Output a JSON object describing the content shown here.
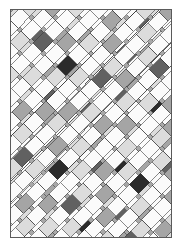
{
  "artwork": {
    "title": "Diagonal Lattice Weave",
    "kind": "abstract-generative-pattern",
    "caption": ""
  },
  "page": {
    "width": 182,
    "height": 247,
    "background_color": "#ffffff",
    "margin_left": 10,
    "margin_top": 9,
    "margin_right": 10,
    "margin_bottom": 9
  },
  "canvas": {
    "x": 10,
    "y": 9,
    "width": 162,
    "height": 229,
    "background_color": "#a8a8a8",
    "border_color": "#5a5a5a",
    "border_width": 1
  },
  "palette": {
    "background_gray": "#a8a8a8",
    "white": "#fbfbfb",
    "light_gray": "#dcdcdc",
    "mid_gray": "#a5a5a5",
    "dark_gray": "#616161",
    "near_black": "#2b2b2b",
    "outline": "#3a3a3a",
    "frame": "#5a5a5a"
  },
  "geometry": {
    "strip_angle_a_deg": 45,
    "strip_angle_b_deg": -45,
    "strip_width": 13,
    "strip_pitch": 17,
    "cell_outline_width": 0.6,
    "description": "Two interleaved families of parallel diagonal bands at plus and minus 45 degrees; each band is chopped into rectangular cells of varying grayscale value, creating a plaited basket-weave lattice clipped to the canvas rectangle."
  },
  "chart_data": {
    "type": "heatmap",
    "title": "Diagonal Lattice Weave",
    "xlabel": "",
    "ylabel": "",
    "legend": [],
    "grid": false,
    "tone_levels": [
      0,
      1,
      2,
      3,
      4
    ],
    "tone_colors": [
      "#fbfbfb",
      "#dcdcdc",
      "#a5a5a5",
      "#616161",
      "#2b2b2b"
    ],
    "tone_labels": [
      "white",
      "light",
      "mid",
      "dark",
      "black"
    ],
    "bands_a": [
      {
        "index": 0,
        "offset": -150,
        "cells": [
          0,
          2,
          0,
          1,
          0,
          3,
          0,
          0,
          1,
          0,
          2,
          0,
          0,
          1,
          0,
          0,
          0,
          2,
          0,
          1
        ]
      },
      {
        "index": 1,
        "offset": -133,
        "cells": [
          1,
          0,
          3,
          0,
          0,
          2,
          0,
          1,
          0,
          0,
          4,
          0,
          1,
          0,
          2,
          0,
          0,
          0,
          1,
          0
        ]
      },
      {
        "index": 2,
        "offset": -116,
        "cells": [
          0,
          1,
          0,
          0,
          2,
          0,
          0,
          3,
          0,
          1,
          0,
          0,
          2,
          0,
          0,
          1,
          0,
          3,
          0,
          0
        ]
      },
      {
        "index": 3,
        "offset": -99,
        "cells": [
          2,
          0,
          1,
          0,
          3,
          0,
          1,
          0,
          0,
          2,
          0,
          0,
          0,
          1,
          4,
          0,
          2,
          0,
          0,
          1
        ]
      },
      {
        "index": 4,
        "offset": -82,
        "cells": [
          0,
          0,
          2,
          1,
          0,
          0,
          1,
          0,
          3,
          0,
          0,
          1,
          0,
          2,
          0,
          0,
          1,
          0,
          0,
          2
        ]
      },
      {
        "index": 5,
        "offset": -65,
        "cells": [
          1,
          3,
          0,
          0,
          1,
          2,
          0,
          0,
          0,
          1,
          2,
          0,
          4,
          0,
          0,
          1,
          0,
          0,
          3,
          0
        ]
      },
      {
        "index": 6,
        "offset": -48,
        "cells": [
          0,
          0,
          1,
          0,
          2,
          0,
          0,
          1,
          0,
          0,
          3,
          0,
          0,
          1,
          2,
          0,
          0,
          2,
          0,
          0
        ]
      },
      {
        "index": 7,
        "offset": -31,
        "cells": [
          2,
          1,
          0,
          3,
          0,
          0,
          2,
          0,
          1,
          0,
          0,
          0,
          1,
          0,
          0,
          3,
          1,
          0,
          0,
          2
        ]
      },
      {
        "index": 8,
        "offset": -14,
        "cells": [
          0,
          0,
          0,
          1,
          0,
          2,
          0,
          0,
          1,
          3,
          0,
          1,
          0,
          0,
          2,
          0,
          0,
          1,
          0,
          0
        ]
      },
      {
        "index": 9,
        "offset": 3,
        "cells": [
          1,
          0,
          2,
          0,
          1,
          0,
          3,
          0,
          0,
          1,
          0,
          2,
          0,
          4,
          0,
          1,
          0,
          0,
          2,
          0
        ]
      },
      {
        "index": 10,
        "offset": 20,
        "cells": [
          0,
          2,
          0,
          0,
          0,
          1,
          0,
          2,
          0,
          0,
          1,
          0,
          3,
          0,
          0,
          0,
          2,
          0,
          1,
          0
        ]
      },
      {
        "index": 11,
        "offset": 37,
        "cells": [
          3,
          0,
          1,
          2,
          0,
          0,
          1,
          0,
          0,
          2,
          0,
          1,
          0,
          0,
          1,
          3,
          0,
          0,
          0,
          1
        ]
      },
      {
        "index": 12,
        "offset": 54,
        "cells": [
          0,
          1,
          0,
          0,
          2,
          0,
          0,
          0,
          1,
          0,
          2,
          0,
          0,
          1,
          0,
          0,
          2,
          1,
          0,
          0
        ]
      },
      {
        "index": 13,
        "offset": 71,
        "cells": [
          2,
          0,
          0,
          1,
          0,
          3,
          1,
          0,
          0,
          0,
          1,
          2,
          0,
          0,
          4,
          0,
          0,
          0,
          1,
          2
        ]
      },
      {
        "index": 14,
        "offset": 88,
        "cells": [
          0,
          1,
          2,
          0,
          0,
          1,
          0,
          2,
          0,
          1,
          0,
          0,
          1,
          0,
          0,
          2,
          0,
          1,
          0,
          0
        ]
      },
      {
        "index": 15,
        "offset": 105,
        "cells": [
          1,
          0,
          0,
          2,
          1,
          0,
          0,
          0,
          3,
          0,
          0,
          1,
          0,
          2,
          0,
          0,
          1,
          0,
          2,
          0
        ]
      },
      {
        "index": 16,
        "offset": 122,
        "cells": [
          0,
          0,
          1,
          0,
          0,
          2,
          1,
          0,
          0,
          1,
          2,
          0,
          0,
          0,
          1,
          0,
          0,
          2,
          0,
          1
        ]
      },
      {
        "index": 17,
        "offset": 139,
        "cells": [
          2,
          1,
          0,
          0,
          3,
          0,
          0,
          1,
          0,
          0,
          0,
          2,
          1,
          0,
          0,
          3,
          0,
          0,
          1,
          0
        ]
      },
      {
        "index": 18,
        "offset": 156,
        "cells": [
          0,
          0,
          2,
          1,
          0,
          0,
          1,
          0,
          2,
          0,
          1,
          0,
          0,
          3,
          0,
          0,
          1,
          0,
          0,
          2
        ]
      },
      {
        "index": 19,
        "offset": 173,
        "cells": [
          1,
          0,
          0,
          0,
          2,
          1,
          0,
          0,
          0,
          1,
          0,
          2,
          0,
          0,
          1,
          0,
          2,
          0,
          1,
          0
        ]
      }
    ],
    "bands_b": [
      {
        "index": 0,
        "offset": -150,
        "cells": [
          0,
          1,
          0,
          2,
          0,
          0,
          1,
          0,
          3,
          0,
          0,
          2,
          0,
          1,
          0,
          0,
          2,
          0,
          0,
          1
        ]
      },
      {
        "index": 1,
        "offset": -133,
        "cells": [
          2,
          0,
          1,
          0,
          0,
          3,
          0,
          1,
          0,
          2,
          0,
          0,
          1,
          0,
          4,
          0,
          0,
          1,
          2,
          0
        ]
      },
      {
        "index": 2,
        "offset": -116,
        "cells": [
          0,
          0,
          2,
          0,
          1,
          0,
          0,
          0,
          2,
          0,
          1,
          0,
          0,
          2,
          0,
          1,
          0,
          0,
          0,
          2
        ]
      },
      {
        "index": 3,
        "offset": -99,
        "cells": [
          1,
          3,
          0,
          1,
          0,
          2,
          0,
          0,
          1,
          0,
          0,
          3,
          0,
          0,
          1,
          0,
          2,
          0,
          1,
          0
        ]
      },
      {
        "index": 4,
        "offset": -82,
        "cells": [
          0,
          0,
          1,
          0,
          0,
          1,
          2,
          0,
          0,
          1,
          0,
          0,
          2,
          0,
          0,
          0,
          1,
          2,
          0,
          0
        ]
      },
      {
        "index": 5,
        "offset": -65,
        "cells": [
          2,
          1,
          0,
          0,
          3,
          0,
          0,
          2,
          0,
          0,
          1,
          4,
          0,
          1,
          0,
          2,
          0,
          0,
          3,
          1
        ]
      },
      {
        "index": 6,
        "offset": -48,
        "cells": [
          0,
          0,
          0,
          1,
          0,
          0,
          1,
          0,
          2,
          0,
          0,
          1,
          0,
          0,
          2,
          0,
          0,
          1,
          0,
          0
        ]
      },
      {
        "index": 7,
        "offset": -31,
        "cells": [
          1,
          2,
          0,
          0,
          1,
          3,
          0,
          0,
          1,
          2,
          0,
          0,
          3,
          1,
          0,
          0,
          1,
          0,
          2,
          0
        ]
      },
      {
        "index": 8,
        "offset": -14,
        "cells": [
          0,
          0,
          2,
          0,
          0,
          1,
          0,
          2,
          0,
          0,
          1,
          0,
          0,
          2,
          0,
          1,
          0,
          0,
          0,
          1
        ]
      },
      {
        "index": 9,
        "offset": 3,
        "cells": [
          3,
          1,
          0,
          2,
          0,
          0,
          4,
          0,
          1,
          0,
          2,
          0,
          1,
          0,
          0,
          3,
          0,
          2,
          0,
          0
        ]
      },
      {
        "index": 10,
        "offset": 20,
        "cells": [
          0,
          0,
          1,
          0,
          2,
          0,
          0,
          1,
          0,
          0,
          0,
          2,
          0,
          1,
          0,
          0,
          1,
          0,
          2,
          0
        ]
      },
      {
        "index": 11,
        "offset": 37,
        "cells": [
          1,
          0,
          0,
          1,
          0,
          3,
          1,
          0,
          2,
          0,
          1,
          0,
          0,
          0,
          2,
          1,
          0,
          0,
          1,
          3
        ]
      },
      {
        "index": 12,
        "offset": 54,
        "cells": [
          0,
          2,
          0,
          0,
          1,
          0,
          0,
          2,
          0,
          1,
          0,
          0,
          1,
          2,
          0,
          0,
          0,
          1,
          0,
          0
        ]
      },
      {
        "index": 13,
        "offset": 71,
        "cells": [
          1,
          0,
          3,
          1,
          0,
          0,
          2,
          0,
          0,
          4,
          0,
          1,
          0,
          0,
          3,
          0,
          2,
          0,
          0,
          1
        ]
      },
      {
        "index": 14,
        "offset": 88,
        "cells": [
          0,
          1,
          0,
          0,
          2,
          1,
          0,
          0,
          1,
          0,
          0,
          2,
          0,
          1,
          0,
          0,
          1,
          0,
          2,
          0
        ]
      },
      {
        "index": 15,
        "offset": 105,
        "cells": [
          2,
          0,
          0,
          1,
          0,
          0,
          3,
          1,
          0,
          0,
          2,
          0,
          0,
          1,
          0,
          3,
          0,
          0,
          1,
          0
        ]
      },
      {
        "index": 16,
        "offset": 122,
        "cells": [
          0,
          1,
          2,
          0,
          1,
          0,
          0,
          0,
          2,
          1,
          0,
          0,
          1,
          0,
          2,
          0,
          0,
          1,
          0,
          2
        ]
      },
      {
        "index": 17,
        "offset": 139,
        "cells": [
          1,
          0,
          0,
          2,
          0,
          1,
          0,
          3,
          0,
          0,
          1,
          0,
          2,
          0,
          0,
          1,
          0,
          0,
          3,
          0
        ]
      },
      {
        "index": 18,
        "offset": 156,
        "cells": [
          0,
          2,
          1,
          0,
          0,
          0,
          1,
          0,
          0,
          2,
          0,
          1,
          0,
          0,
          1,
          0,
          2,
          0,
          0,
          1
        ]
      },
      {
        "index": 19,
        "offset": 173,
        "cells": [
          2,
          0,
          0,
          1,
          3,
          0,
          0,
          1,
          0,
          0,
          2,
          0,
          1,
          0,
          0,
          2,
          0,
          1,
          0,
          0
        ]
      }
    ]
  }
}
